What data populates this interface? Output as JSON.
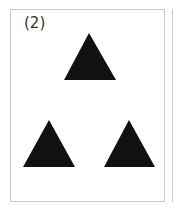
{
  "figure": {
    "label": "(2)",
    "shape_color": "#111111",
    "border_color": "#c8c8c8",
    "triangles": [
      {
        "name": "top",
        "points": "89,33 64,80 116,80"
      },
      {
        "name": "bottom-left",
        "points": "49,120 23,167 75,167"
      },
      {
        "name": "bottom-right",
        "points": "129,120 104,167 155,167"
      }
    ]
  }
}
